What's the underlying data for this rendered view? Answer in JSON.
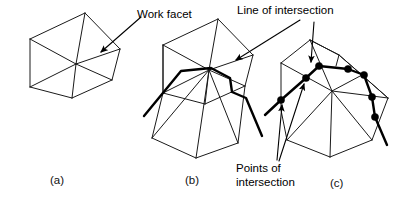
{
  "figure": {
    "caption_a": "(a)",
    "caption_b": "(b)",
    "caption_c": "(c)",
    "label_work_facet": "Work facet",
    "label_line_of_intersection": "Line of intersection",
    "label_points_of_intersection_1": "Points of",
    "label_points_of_intersection_2": "intersection",
    "colors": {
      "background": "#ffffff",
      "mesh_edge": "#1a1a1a",
      "cut_line": "#000000",
      "node_dot": "#000000",
      "text": "#000000"
    },
    "panels": [
      {
        "id": "a",
        "caption": "(a)",
        "description": "Polyhedron mesh with triangulated facets, one highlighted as the work facet",
        "mesh_paths": [
          "M 30,39 L 85,13",
          "M 85,13 L 120,49",
          "M 120,49 L 112,80",
          "M 112,80 L 72,98",
          "M 72,98 L 30,87",
          "M 30,87 L 30,39",
          "M 30,39 L 76,64",
          "M 76,64 L 85,13",
          "M 76,64 L 120,49",
          "M 76,64 L 112,80",
          "M 76,64 L 72,98",
          "M 76,64 L 30,87"
        ],
        "cut_paths": [],
        "dots": []
      },
      {
        "id": "b",
        "caption": "(b)",
        "description": "Same polyhedron crossed by a heavy polyline representing the line of intersection",
        "mesh_paths": [
          "M 163,45 L 218,19",
          "M 218,19 L 253,55",
          "M 253,55 L 245,86",
          "M 245,86 L 205,104",
          "M 205,104 L 163,93",
          "M 163,93 L 163,45",
          "M 163,45 L 209,70",
          "M 209,70 L 218,19",
          "M 209,70 L 253,55",
          "M 209,70 L 245,86",
          "M 209,70 L 205,104",
          "M 209,70 L 163,93",
          "M 163,45 L 163,93",
          "M 163,93 L 152,138",
          "M 152,138 L 196,158",
          "M 196,158 L 238,143",
          "M 238,143 L 245,86",
          "M 152,138 L 209,70",
          "M 196,158 L 209,70",
          "M 238,143 L 209,70"
        ],
        "cut_paths": [
          "M 144,116 L 181,71 L 211,68 L 230,78 L 232,92 L 246,98 L 262,136"
        ],
        "dots": []
      },
      {
        "id": "c",
        "caption": "(c)",
        "description": "Same polyhedron with black dots marking each point where the intersection line crosses an edge",
        "mesh_paths": [
          "M 281,63 L 310,40",
          "M 310,40 L 339,55",
          "M 339,55 L 336,66",
          "M 281,63 L 281,110",
          "M 281,110 L 287,140",
          "M 287,140 L 330,157",
          "M 330,157 L 372,140",
          "M 372,140 L 388,98",
          "M 388,98 L 339,55",
          "M 281,63 L 332,91",
          "M 332,91 L 310,40",
          "M 332,91 L 362,75",
          "M 332,91 L 388,98",
          "M 332,91 L 330,157",
          "M 332,91 L 287,140",
          "M 332,91 L 372,140",
          "M 362,75 L 339,55",
          "M 362,75 L 388,98",
          "M 310,40 L 339,55"
        ],
        "cut_paths": [
          "M 265,115 L 281,100 L 306,78 L 319,66 L 348,69 L 364,75 L 372,97 L 375,117 L 387,145"
        ],
        "dots": [
          {
            "x": 281,
            "y": 100,
            "r": 3.6
          },
          {
            "x": 306,
            "y": 78,
            "r": 3.6
          },
          {
            "x": 319,
            "y": 66,
            "r": 3.6
          },
          {
            "x": 348,
            "y": 69,
            "r": 3.6
          },
          {
            "x": 364,
            "y": 75,
            "r": 3.6
          },
          {
            "x": 372,
            "y": 97,
            "r": 3.6
          },
          {
            "x": 375,
            "y": 117,
            "r": 3.6
          }
        ]
      }
    ],
    "leaders": [
      {
        "name": "work-facet-leader",
        "path": "M 141,17 L 101,52",
        "arrow_at": "end",
        "target_panel": "a"
      },
      {
        "name": "line-of-intersection-leader-b",
        "path": "M 300,20 L 236,60",
        "arrow_at": "end",
        "target_panel": "b"
      },
      {
        "name": "line-of-intersection-leader-c",
        "path": "M 314,22 L 311,62",
        "arrow_at": "end",
        "target_panel": "c"
      },
      {
        "name": "points-of-intersection-leader-1",
        "path": "M 277,160 L 282,105",
        "arrow_at": "end",
        "target_panel": "c"
      },
      {
        "name": "points-of-intersection-leader-2",
        "path": "M 279,161 L 304,84",
        "arrow_at": "end",
        "target_panel": "c"
      }
    ]
  }
}
